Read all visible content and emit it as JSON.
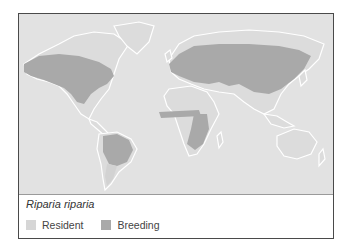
{
  "map": {
    "title": "Riparia riparia",
    "colors": {
      "ocean": "#e2e2e2",
      "land": "#dcdcdc",
      "coast": "#ffffff",
      "resident": "#d6d6d6",
      "breeding": "#a9a9a9"
    },
    "legend": [
      {
        "label": "Resident",
        "color": "#d6d6d6"
      },
      {
        "label": "Breeding",
        "color": "#a9a9a9"
      }
    ]
  }
}
